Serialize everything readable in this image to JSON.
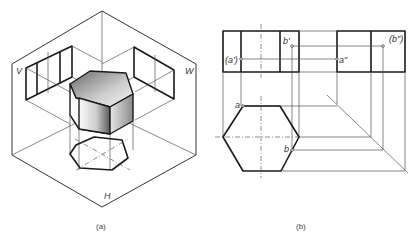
{
  "figure_a": {
    "caption": "(a)",
    "plane_labels": {
      "v": "V",
      "w": "W",
      "h": "H"
    },
    "object": "hexagonal prism",
    "colors": {
      "line": "#1a1a1a",
      "shade_dark": "#555555",
      "shade_light": "#f2f2f2"
    }
  },
  "figure_b": {
    "caption": "(b)",
    "point_labels": {
      "a_front": "(a')",
      "b_front": "b'",
      "a_side": "a\"",
      "b_side": "(b\")",
      "a_top": "a",
      "b_top": "b"
    }
  }
}
